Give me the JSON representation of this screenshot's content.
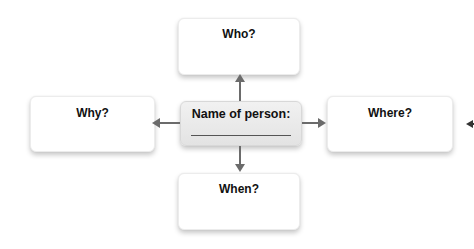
{
  "diagram": {
    "center": {
      "label": "Name of person:",
      "blank_line": true
    },
    "nodes": {
      "top": {
        "label": "Who?"
      },
      "left": {
        "label": "Why?"
      },
      "right": {
        "label": "Where?"
      },
      "bottom": {
        "label": "When?"
      }
    },
    "colors": {
      "arrow": "#6b6b6b",
      "box_fill": "#ffffff",
      "center_fill": "#e8e8e8",
      "text": "#111111"
    }
  }
}
